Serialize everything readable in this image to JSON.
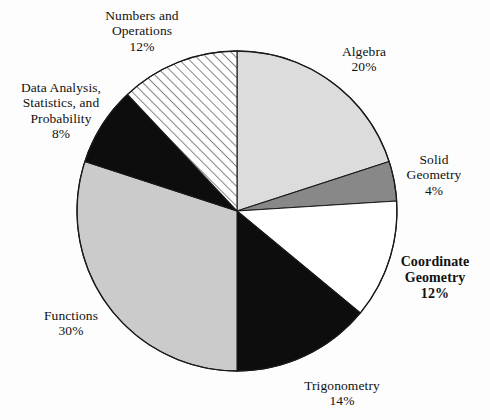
{
  "background_color": "#fdfdfd",
  "geometry": {
    "center_x": 237,
    "center_y": 211,
    "radius": 160,
    "start_angle_deg": -90
  },
  "chart_data": {
    "type": "pie",
    "title": "",
    "subtitle": "",
    "xlabel": "",
    "ylabel": "",
    "legend_position": "none",
    "grid": false,
    "units": "percent",
    "total": 100,
    "categories": [
      "Algebra",
      "Solid Geometry",
      "Coordinate Geometry",
      "Trigonometry",
      "Functions",
      "Data Analysis, Statistics, and Probability",
      "Numbers and Operations"
    ],
    "values": [
      20,
      4,
      12,
      14,
      30,
      8,
      12
    ],
    "slices": [
      {
        "id": "algebra",
        "label": "Algebra",
        "label_lines": [
          "Algebra"
        ],
        "value": 20,
        "percent_text": "20%",
        "fill": "#dcdcdc",
        "pattern": "solid",
        "emphasis": false
      },
      {
        "id": "solid-geometry",
        "label": "Solid Geometry",
        "label_lines": [
          "Solid",
          "Geometry"
        ],
        "value": 4,
        "percent_text": "4%",
        "fill": "#888888",
        "pattern": "solid",
        "emphasis": false
      },
      {
        "id": "coordinate-geometry",
        "label": "Coordinate Geometry",
        "label_lines": [
          "Coordinate",
          "Geometry"
        ],
        "value": 12,
        "percent_text": "12%",
        "fill": "#ffffff",
        "pattern": "solid",
        "emphasis": true
      },
      {
        "id": "trigonometry",
        "label": "Trigonometry",
        "label_lines": [
          "Trigonometry"
        ],
        "value": 14,
        "percent_text": "14%",
        "fill": "#0d0d0d",
        "pattern": "solid",
        "emphasis": false
      },
      {
        "id": "functions",
        "label": "Functions",
        "label_lines": [
          "Functions"
        ],
        "value": 30,
        "percent_text": "30%",
        "fill": "#cbcbcb",
        "pattern": "solid",
        "emphasis": false
      },
      {
        "id": "data-analysis",
        "label": "Data Analysis, Statistics, and Probability",
        "label_lines": [
          "Data Analysis,",
          "Statistics, and",
          "Probability"
        ],
        "value": 8,
        "percent_text": "8%",
        "fill": "#0d0d0d",
        "pattern": "solid",
        "emphasis": false
      },
      {
        "id": "numbers-operations",
        "label": "Numbers and Operations",
        "label_lines": [
          "Numbers and",
          "Operations"
        ],
        "value": 12,
        "percent_text": "12%",
        "fill": "#ffffff",
        "pattern": "diagonal-hatch",
        "emphasis": false
      }
    ]
  },
  "labels": {
    "numbers_operations": {
      "line1": "Numbers and",
      "line2": "Operations",
      "pct": "12%"
    },
    "algebra": {
      "line1": "Algebra",
      "pct": "20%"
    },
    "solid_geometry": {
      "line1": "Solid",
      "line2": "Geometry",
      "pct": "4%"
    },
    "coordinate_geometry": {
      "line1": "Coordinate",
      "line2": "Geometry",
      "pct": "12%"
    },
    "trigonometry": {
      "line1": "Trigonometry",
      "pct": "14%"
    },
    "functions": {
      "line1": "Functions",
      "pct": "30%"
    },
    "data_analysis": {
      "line1": "Data Analysis,",
      "line2": "Statistics, and",
      "line3": "Probability",
      "pct": "8%"
    }
  }
}
